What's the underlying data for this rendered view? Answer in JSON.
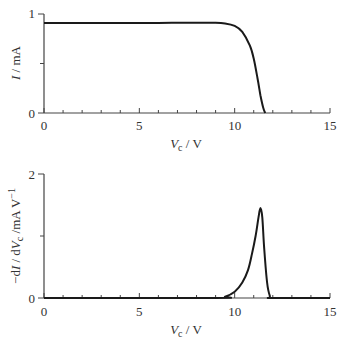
{
  "chart_data": [
    {
      "type": "line",
      "title": "",
      "xlabel": "V_c / V",
      "ylabel": "I / mA",
      "xlim": [
        0,
        15
      ],
      "ylim": [
        0,
        1
      ],
      "xticks": [
        0,
        5,
        10,
        15
      ],
      "yticks": [
        0,
        1
      ],
      "grid": false,
      "series": [
        {
          "name": "I",
          "x": [
            0,
            2,
            4,
            6,
            8,
            9,
            9.5,
            10,
            10.4,
            10.8,
            11.0,
            11.2,
            11.35,
            11.5,
            11.6
          ],
          "y": [
            0.91,
            0.91,
            0.91,
            0.91,
            0.912,
            0.912,
            0.905,
            0.88,
            0.82,
            0.68,
            0.55,
            0.35,
            0.18,
            0.05,
            0.0
          ]
        }
      ]
    },
    {
      "type": "line",
      "title": "",
      "xlabel": "V_c / V",
      "ylabel": "-dI / dV_c /mA V^-1",
      "xlim": [
        0,
        15
      ],
      "ylim": [
        0,
        2
      ],
      "xticks": [
        0,
        5,
        10,
        15
      ],
      "yticks": [
        0,
        1,
        2
      ],
      "grid": false,
      "series": [
        {
          "name": "-dI/dVc",
          "x": [
            0,
            9.0,
            9.5,
            10.0,
            10.4,
            10.7,
            10.9,
            11.1,
            11.25,
            11.35,
            11.45,
            11.55,
            11.7,
            11.85,
            12.0,
            15
          ],
          "y": [
            0,
            0,
            0.02,
            0.1,
            0.25,
            0.45,
            0.7,
            1.0,
            1.3,
            1.45,
            1.3,
            0.8,
            0.25,
            0.03,
            0,
            0
          ]
        }
      ]
    }
  ],
  "top": {
    "ylabel_main": "I",
    "ylabel_unit": " / mA",
    "xlabel_var": "V",
    "xlabel_sub": "c",
    "xlabel_unit": " / V",
    "xticks": [
      "0",
      "5",
      "10",
      "15"
    ],
    "yticks": [
      "0",
      "1"
    ]
  },
  "bottom": {
    "ylabel_prefix": "−d",
    "ylabel_I": "I",
    "ylabel_mid": " / d",
    "ylabel_V": "V",
    "ylabel_sub": "c",
    "ylabel_unit": " /mA V",
    "ylabel_sup": "−1",
    "xlabel_var": "V",
    "xlabel_sub": "c",
    "xlabel_unit": " / V",
    "xticks": [
      "0",
      "5",
      "10",
      "15"
    ],
    "yticks": [
      "0",
      "1",
      "2"
    ]
  }
}
